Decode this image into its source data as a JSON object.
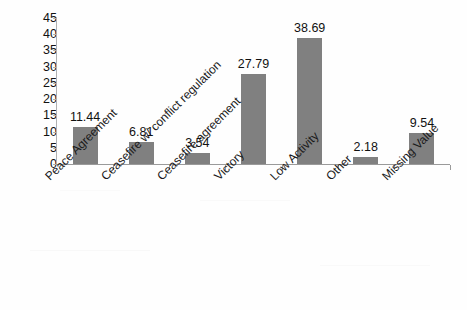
{
  "chart_data": {
    "type": "bar",
    "title": "",
    "subtitle": "",
    "xlabel": "",
    "ylabel": "",
    "categories": [
      "Peace Agreement",
      "Ceasefire w/ conflict regulation",
      "Ceasefire agreement",
      "Victory",
      "Low Activity",
      "Other",
      "Missing Value"
    ],
    "values": [
      11.44,
      6.81,
      3.54,
      27.79,
      38.69,
      2.18,
      9.54
    ],
    "data_labels": [
      "11.44",
      "6.81",
      "3.54",
      "27.79",
      "38.69",
      "2.18",
      "9.54"
    ],
    "ylim": [
      0,
      45
    ],
    "ytick_step": 5,
    "ytick_labels": [
      "0",
      "5",
      "10",
      "15",
      "20",
      "25",
      "30",
      "35",
      "40",
      "45"
    ],
    "grid": false,
    "legend": null,
    "legend_position": "none",
    "bar_color": "#808080",
    "axis_color": "#9a9a9a",
    "text_color": "#111111",
    "background_color": "#ffffff",
    "label_rotation_deg": -45
  }
}
